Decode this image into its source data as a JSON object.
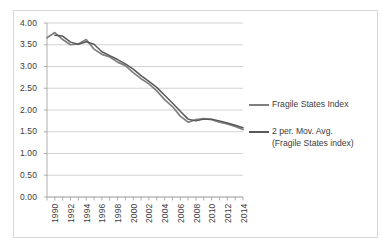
{
  "chart_data": {
    "type": "line",
    "title": "",
    "xlabel": "",
    "ylabel": "",
    "ylim": [
      0.0,
      4.0
    ],
    "ytick_labels": [
      "4.00",
      "3.50",
      "3.00",
      "2.50",
      "2.00",
      "1.50",
      "1.00",
      "0.50",
      "0.00"
    ],
    "ytick_values": [
      4.0,
      3.5,
      3.0,
      2.5,
      2.0,
      1.5,
      1.0,
      0.5,
      0.0
    ],
    "grid": "horizontal",
    "legend_position": "right",
    "x": [
      1990,
      1991,
      1992,
      1993,
      1994,
      1995,
      1996,
      1997,
      1998,
      1999,
      2000,
      2001,
      2002,
      2003,
      2004,
      2005,
      2006,
      2007,
      2008,
      2009,
      2010,
      2011,
      2012,
      2013,
      2014,
      2015
    ],
    "xtick_labels": [
      "1990",
      "1992",
      "1994",
      "1996",
      "1998",
      "2000",
      "2002",
      "2004",
      "2006",
      "2008",
      "2010",
      "2012",
      "2014"
    ],
    "xtick_values": [
      1990,
      1992,
      1994,
      1996,
      1998,
      2000,
      2002,
      2004,
      2006,
      2008,
      2010,
      2012,
      2014
    ],
    "series": [
      {
        "name": "Fragile States Index",
        "color": "#7f7f7f",
        "values": [
          3.66,
          3.78,
          3.62,
          3.5,
          3.52,
          3.62,
          3.4,
          3.28,
          3.22,
          3.1,
          3.02,
          2.86,
          2.72,
          2.6,
          2.44,
          2.24,
          2.08,
          1.86,
          1.72,
          1.78,
          1.8,
          1.78,
          1.72,
          1.68,
          1.62,
          1.55
        ]
      },
      {
        "name": "2 per. Mov. Avg. (Fragile States index)",
        "color": "#595959",
        "values": [
          null,
          3.72,
          3.7,
          3.56,
          3.51,
          3.57,
          3.51,
          3.34,
          3.25,
          3.16,
          3.06,
          2.94,
          2.79,
          2.66,
          2.52,
          2.34,
          2.16,
          1.97,
          1.79,
          1.75,
          1.79,
          1.79,
          1.75,
          1.7,
          1.65,
          1.59
        ]
      }
    ]
  },
  "legend": {
    "entries": [
      {
        "label": "Fragile States Index",
        "label_line2": "",
        "color": "#7f7f7f"
      },
      {
        "label": "2 per. Mov. Avg.",
        "label_line2": "(Fragile States index)",
        "color": "#595959"
      }
    ]
  },
  "colors": {
    "frame_border": "#d9d9d9",
    "gridline": "#c6c6c6",
    "axis": "#a6a6a6",
    "text": "#3c3c3c",
    "background": "#ffffff"
  }
}
